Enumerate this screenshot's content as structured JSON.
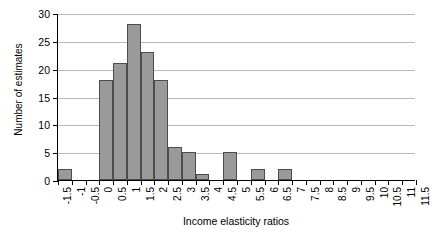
{
  "chart_data": {
    "type": "bar",
    "title": "",
    "subtitle": "",
    "xlabel": "Income elasticity ratios",
    "ylabel": "Number of estimates",
    "grid": true,
    "legend": "none",
    "xlim": [
      -1.5,
      11.5
    ],
    "ylim": [
      0,
      30
    ],
    "ytick_labels": [
      "0",
      "5",
      "10",
      "15",
      "20",
      "25",
      "30"
    ],
    "ytick_values": [
      0,
      5,
      10,
      15,
      20,
      25,
      30
    ],
    "xtick_labels": [
      "-1.5",
      "-1",
      "-0.5",
      "0",
      "0.5",
      "1",
      "1.5",
      "2",
      "2.5",
      "3",
      "3.5",
      "4",
      "4.5",
      "5",
      "5.5",
      "6",
      "6.5",
      "7",
      "7.5",
      "8",
      "8.5",
      "9",
      "9.5",
      "10",
      "10.5",
      "11",
      "11.5"
    ],
    "xtick_values": [
      -1.5,
      -1,
      -0.5,
      0,
      0.5,
      1,
      1.5,
      2,
      2.5,
      3,
      3.5,
      4,
      4.5,
      5,
      5.5,
      6,
      6.5,
      7,
      7.5,
      8,
      8.5,
      9,
      9.5,
      10,
      10.5,
      11,
      11.5
    ],
    "bin_width": 0.5,
    "bin_starts": [
      -1.5,
      -1.0,
      -0.5,
      0.0,
      0.5,
      1.0,
      1.5,
      2.0,
      2.5,
      3.0,
      3.5,
      4.0,
      4.5,
      5.0,
      5.5,
      6.0,
      6.5,
      7.0,
      7.5,
      8.0,
      8.5,
      9.0,
      9.5,
      10.0,
      10.5,
      11.0
    ],
    "values": [
      2,
      0,
      0,
      18,
      21,
      28,
      23,
      18,
      6,
      5,
      1,
      0,
      5,
      0,
      2,
      0,
      2,
      0,
      0,
      0,
      0,
      0,
      0,
      0,
      0,
      0
    ],
    "bars": [
      {
        "bin_start": -1.5,
        "bin_end": -1.0,
        "value": 2
      },
      {
        "bin_start": 0.0,
        "bin_end": 0.5,
        "value": 18
      },
      {
        "bin_start": 0.5,
        "bin_end": 1.0,
        "value": 21
      },
      {
        "bin_start": 1.0,
        "bin_end": 1.5,
        "value": 28
      },
      {
        "bin_start": 1.5,
        "bin_end": 2.0,
        "value": 23
      },
      {
        "bin_start": 2.0,
        "bin_end": 2.5,
        "value": 18
      },
      {
        "bin_start": 2.5,
        "bin_end": 3.0,
        "value": 6
      },
      {
        "bin_start": 3.0,
        "bin_end": 3.5,
        "value": 5
      },
      {
        "bin_start": 3.5,
        "bin_end": 4.0,
        "value": 1
      },
      {
        "bin_start": 4.5,
        "bin_end": 5.0,
        "value": 5
      },
      {
        "bin_start": 5.5,
        "bin_end": 6.0,
        "value": 2
      },
      {
        "bin_start": 6.5,
        "bin_end": 7.0,
        "value": 2
      }
    ],
    "colors": {
      "bar_fill": "#9a9a9a",
      "bar_border": "#4d4d4d",
      "gridline": "#b9b9b9",
      "axis": "#000000",
      "background": "#ffffff"
    }
  }
}
